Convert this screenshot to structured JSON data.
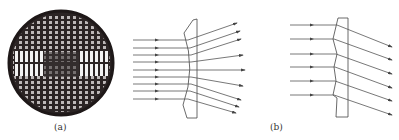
{
  "figure": {
    "panel_a": {
      "label": "(a)",
      "wafer": {
        "cx": 61,
        "cy": 63,
        "r": 52,
        "color": "#2b2424"
      },
      "lens": {
        "type": "plano-concave",
        "color": "#444444"
      },
      "rays_in_y": [
        40,
        48,
        55,
        62,
        70,
        77,
        84,
        91,
        99
      ],
      "rays_out_end": [
        [
          237,
          23
        ],
        [
          240,
          31
        ],
        [
          241,
          39
        ],
        [
          243,
          55
        ],
        [
          245,
          70
        ],
        [
          243,
          86
        ],
        [
          241,
          100
        ],
        [
          239,
          107
        ],
        [
          236,
          113
        ]
      ]
    },
    "panel_b": {
      "label": "(b)",
      "lens": {
        "type": "fresnel",
        "color": "#444444"
      },
      "rays_in_y": [
        25,
        39,
        54,
        67,
        81,
        95
      ],
      "rays_out_end_y": [
        47,
        60,
        74,
        88,
        101,
        115
      ]
    },
    "colors": {
      "line": "#555555",
      "background": "#ffffff"
    }
  }
}
